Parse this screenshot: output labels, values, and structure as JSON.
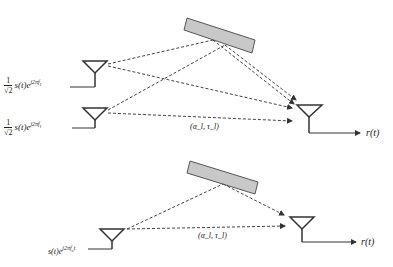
{
  "caption": "",
  "top_diagram": {
    "tx1_label": {
      "scale_num": "1",
      "scale_den": "√2",
      "signal": "s(t)e",
      "exponent": "j2πf",
      "sub": "l"
    },
    "tx2_label": {
      "scale_num": "1",
      "scale_den": "√2",
      "signal": "s(t)e",
      "exponent": "j2πf",
      "sub": "l"
    },
    "path_label": "(α_l, τ_l)",
    "output_label": "r(t)"
  },
  "bottom_diagram": {
    "tx_label": {
      "signal": "s(t)e",
      "exponent": "j2πf",
      "sub": "c",
      "tail": "t"
    },
    "path_label": "(α_l, τ_l)",
    "output_label": "r(t)"
  },
  "colors": {
    "line": "#333333",
    "reflector_fill": "#c8c8c8",
    "reflector_stroke": "#555555"
  }
}
